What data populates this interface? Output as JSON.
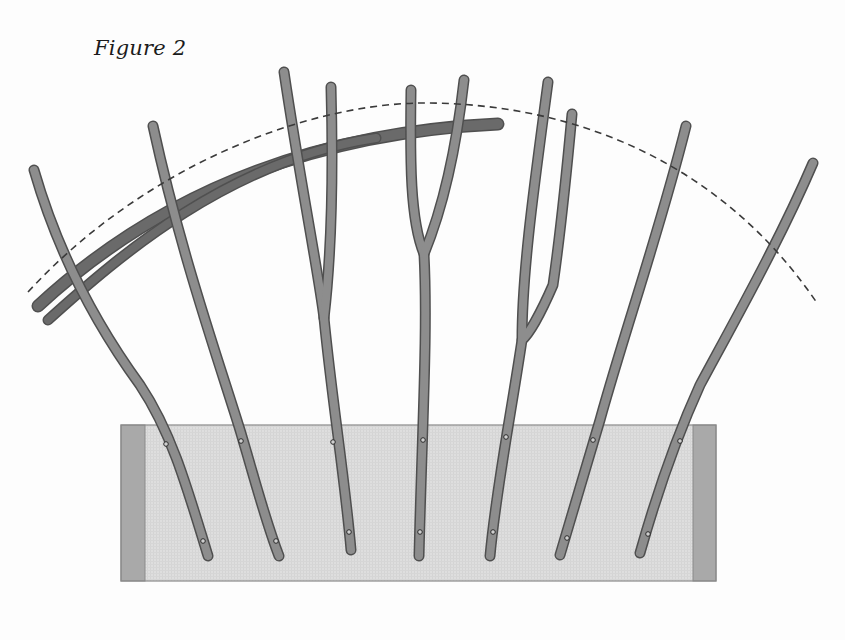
{
  "figure": {
    "title": "Figure 2"
  },
  "colors": {
    "background": "#fdfdfd",
    "stick_fill": "#8d8d8d",
    "stick_edge": "#4f4f4f",
    "bar_fill": "#6a6a6a",
    "bar_edge": "#505050",
    "box_fill": "#dedede",
    "box_end_fill": "#a9a9a9",
    "box_border": "#8a8a8a",
    "dash": "#3a3a3a",
    "peg": "#2a2a2a"
  },
  "trough": {
    "x": 121,
    "y": 425,
    "width": 595,
    "height": 156,
    "end_width_left": 24,
    "end_width_right": 23
  },
  "dashed_arc": {
    "path": "M28,292 C140,170 300,105 420,103 C570,102 720,160 817,303"
  },
  "bars": [
    {
      "name": "upper-bar",
      "path": "M38,306 C120,230 260,135 498,124",
      "width": 11
    },
    {
      "name": "lower-bar",
      "path": "M48,320 C120,255 230,160 376,138",
      "width": 9
    }
  ],
  "sticks": [
    {
      "id": 1,
      "paths": [
        "M34,170 C60,260 100,330 140,385 C170,430 185,480 208,556"
      ],
      "pegs": [
        [
          166,
          444
        ],
        [
          203,
          541
        ]
      ]
    },
    {
      "id": 2,
      "paths": [
        "M153,126 C180,250 215,350 240,430 C255,480 265,520 279,556"
      ],
      "pegs": [
        [
          241,
          441
        ],
        [
          276,
          541
        ]
      ]
    },
    {
      "id": 3,
      "paths": [
        "M284,72 C300,180 318,270 324,318 C332,400 345,480 351,550",
        "M331,87 C333,160 332,250 324,318"
      ],
      "pegs": [
        [
          333,
          442
        ],
        [
          349,
          532
        ]
      ]
    },
    {
      "id": 4,
      "paths": [
        "M411,90 C410,160 410,220 424,254 C428,330 422,430 419,556",
        "M464,80 C455,160 440,215 424,254"
      ],
      "pegs": [
        [
          423,
          440
        ],
        [
          420,
          532
        ]
      ]
    },
    {
      "id": 5,
      "paths": [
        "M548,82 C535,180 522,270 522,340 C510,420 496,490 490,556",
        "M572,114 C565,190 558,250 553,285 C540,315 528,335 522,340"
      ],
      "pegs": [
        [
          506,
          437
        ],
        [
          493,
          532
        ]
      ]
    },
    {
      "id": 6,
      "paths": [
        "M686,126 C660,230 625,330 600,420 C585,470 570,520 560,555"
      ],
      "pegs": [
        [
          593,
          440
        ],
        [
          567,
          538
        ]
      ]
    },
    {
      "id": 7,
      "paths": [
        "M813,163 C780,240 735,320 700,385 C675,440 655,500 640,553"
      ],
      "pegs": [
        [
          680,
          441
        ],
        [
          648,
          534
        ]
      ]
    }
  ]
}
